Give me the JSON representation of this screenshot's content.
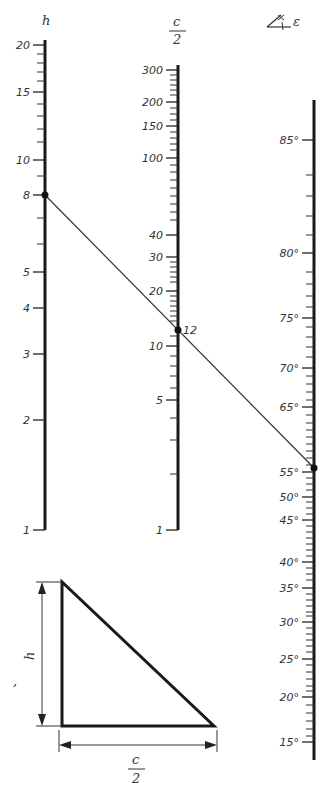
{
  "nomogram": {
    "scales": [
      {
        "id": "h",
        "title": "h",
        "x": 45,
        "y_top": 40,
        "y_bottom": 530,
        "labels": [
          {
            "text": "20",
            "y": 45
          },
          {
            "text": "15",
            "y": 92
          },
          {
            "text": "10",
            "y": 160
          },
          {
            "text": "8",
            "y": 195
          },
          {
            "text": "5",
            "y": 272
          },
          {
            "text": "4",
            "y": 308
          },
          {
            "text": "3",
            "y": 354
          },
          {
            "text": "2",
            "y": 420
          },
          {
            "text": "1",
            "y": 530
          }
        ],
        "minor_ticks": [
          54,
          63,
          72,
          81,
          104,
          116,
          129,
          142,
          176,
          218,
          244
        ]
      },
      {
        "id": "c_half",
        "title_num": "c",
        "title_den": "2",
        "x": 178,
        "y_top": 65,
        "y_bottom": 530,
        "labels": [
          {
            "text": "300",
            "y": 70
          },
          {
            "text": "200",
            "y": 102
          },
          {
            "text": "150",
            "y": 126
          },
          {
            "text": "100",
            "y": 158
          },
          {
            "text": "40",
            "y": 235
          },
          {
            "text": "30",
            "y": 257
          },
          {
            "text": "20",
            "y": 291
          },
          {
            "text": "12",
            "y": 330
          },
          {
            "text": "10",
            "y": 346
          },
          {
            "text": "5",
            "y": 400
          },
          {
            "text": "1",
            "y": 530
          }
        ],
        "minor_ticks": [
          75,
          80,
          85,
          90,
          95,
          108,
          114,
          120,
          132,
          138,
          144,
          150,
          165,
          172,
          180,
          188,
          196,
          204,
          212,
          220,
          262,
          267,
          272,
          277,
          282,
          296,
          301,
          306,
          311,
          316,
          321,
          336,
          356,
          366,
          376,
          388,
          418,
          440,
          474
        ]
      },
      {
        "id": "epsilon",
        "title": "∢ ε",
        "x": 314,
        "y_top": 100,
        "y_bottom": 760,
        "labels": [
          {
            "text": "85°",
            "y": 140
          },
          {
            "text": "80°",
            "y": 253
          },
          {
            "text": "75°",
            "y": 318
          },
          {
            "text": "70°",
            "y": 368
          },
          {
            "text": "65°",
            "y": 407
          },
          {
            "text": "55°",
            "y": 472
          },
          {
            "text": "50°",
            "y": 497
          },
          {
            "text": "45°",
            "y": 520
          },
          {
            "text": "40°",
            "y": 562
          },
          {
            "text": "35°",
            "y": 588
          },
          {
            "text": "30°",
            "y": 622
          },
          {
            "text": "25°",
            "y": 659
          },
          {
            "text": "20°",
            "y": 697
          },
          {
            "text": "15°",
            "y": 742
          }
        ],
        "minor_ticks": [
          175,
          196,
          216,
          235,
          272,
          284,
          296,
          307,
          327,
          337,
          347,
          357,
          376,
          384,
          392,
          400,
          415,
          423,
          430,
          437,
          444,
          451,
          458,
          465,
          478,
          484,
          490,
          502,
          508,
          514,
          526,
          532,
          538,
          544,
          550,
          556,
          568,
          574,
          580,
          594,
          600,
          606,
          612,
          616,
          628,
          634,
          640,
          646,
          652,
          665,
          672,
          679,
          686,
          691,
          705,
          713,
          721,
          729,
          736
        ]
      }
    ],
    "solution_line": {
      "points": [
        {
          "scale": "h",
          "value": "8",
          "x": 45,
          "y": 195
        },
        {
          "scale": "c_half",
          "value": "12",
          "x": 178,
          "y": 330
        },
        {
          "scale": "epsilon",
          "value": "~56°",
          "x": 314,
          "y": 468
        }
      ],
      "label": "12"
    },
    "header_icon": "angle-symbol"
  },
  "triangle": {
    "height_label": "h",
    "base_label_num": "c",
    "base_label_den": "2",
    "stray_mark": ","
  },
  "caption_partial": "Bild 4.19 — Nomogramm"
}
